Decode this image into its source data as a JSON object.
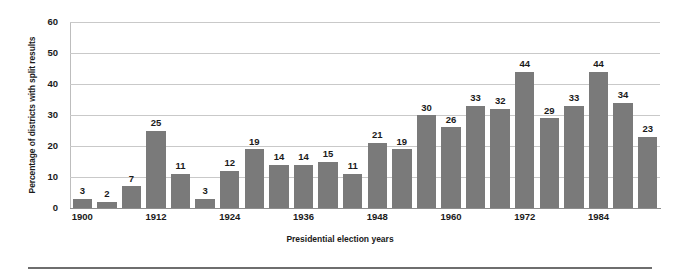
{
  "chart_data": {
    "type": "bar",
    "title": "",
    "xlabel": "Presidential election years",
    "ylabel": "Percentage of districts with split results",
    "ylim": [
      0,
      60
    ],
    "yticks": [
      0,
      10,
      20,
      30,
      40,
      50,
      60
    ],
    "grid": true,
    "legend": "none",
    "bar_color": "#7a7a7a",
    "grid_color": "#c9c9c9",
    "axis_color": "#8d8d8d",
    "categories": [
      "1900",
      "1904",
      "1908",
      "1912",
      "1916",
      "1920",
      "1924",
      "1928",
      "1932",
      "1936",
      "1940",
      "1944",
      "1948",
      "1952",
      "1956",
      "1960",
      "1964",
      "1968",
      "1972",
      "1976",
      "1980",
      "1984",
      "1988",
      "1992"
    ],
    "visible_xtick_labels": [
      "1900",
      "1912",
      "1924",
      "1936",
      "1948",
      "1960",
      "1972",
      "1984"
    ],
    "visible_xtick_indices": [
      0,
      3,
      6,
      9,
      12,
      15,
      18,
      21
    ],
    "values": [
      3,
      2,
      7,
      25,
      11,
      3,
      12,
      19,
      14,
      14,
      15,
      11,
      21,
      19,
      30,
      26,
      33,
      32,
      44,
      29,
      33,
      44,
      34,
      23
    ],
    "data_labels": [
      "3",
      "2",
      "7",
      "25",
      "11",
      "3",
      "12",
      "19",
      "14",
      "14",
      "15",
      "11",
      "21",
      "19",
      "30",
      "26",
      "33",
      "32",
      "44",
      "29",
      "33",
      "44",
      "34",
      "23"
    ]
  }
}
